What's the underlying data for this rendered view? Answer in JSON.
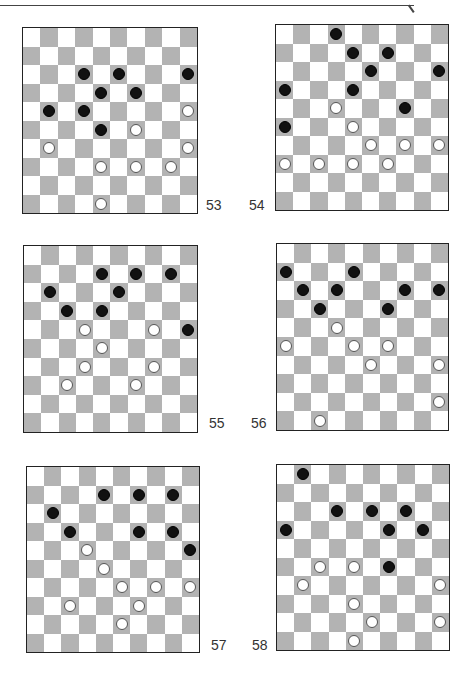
{
  "header": {
    "text": ""
  },
  "colors": {
    "dark_square": "#b3b3b3",
    "light_square": "#ffffff",
    "black_piece": "#111111",
    "white_piece": "#ffffff"
  },
  "boards": [
    {
      "number": "53",
      "black": [
        [
          2,
          3
        ],
        [
          2,
          5
        ],
        [
          2,
          9
        ],
        [
          3,
          4
        ],
        [
          3,
          6
        ],
        [
          4,
          1
        ],
        [
          4,
          3
        ],
        [
          5,
          4
        ]
      ],
      "white": [
        [
          4,
          9
        ],
        [
          5,
          6
        ],
        [
          6,
          1
        ],
        [
          6,
          9
        ],
        [
          7,
          4
        ],
        [
          7,
          6
        ],
        [
          7,
          8
        ],
        [
          9,
          4
        ]
      ]
    },
    {
      "number": "54",
      "black": [
        [
          0,
          3
        ],
        [
          1,
          4
        ],
        [
          1,
          6
        ],
        [
          2,
          5
        ],
        [
          2,
          9
        ],
        [
          3,
          0
        ],
        [
          3,
          4
        ],
        [
          4,
          7
        ],
        [
          5,
          0
        ]
      ],
      "white": [
        [
          4,
          3
        ],
        [
          5,
          4
        ],
        [
          6,
          5
        ],
        [
          6,
          7
        ],
        [
          6,
          9
        ],
        [
          7,
          0
        ],
        [
          7,
          2
        ],
        [
          7,
          4
        ],
        [
          7,
          6
        ]
      ]
    },
    {
      "number": "55",
      "black": [
        [
          1,
          4
        ],
        [
          1,
          6
        ],
        [
          1,
          8
        ],
        [
          2,
          1
        ],
        [
          2,
          5
        ],
        [
          3,
          2
        ],
        [
          3,
          4
        ],
        [
          4,
          9
        ]
      ],
      "white": [
        [
          4,
          3
        ],
        [
          4,
          7
        ],
        [
          5,
          4
        ],
        [
          6,
          3
        ],
        [
          6,
          7
        ],
        [
          7,
          2
        ],
        [
          7,
          6
        ]
      ]
    },
    {
      "number": "56",
      "black": [
        [
          1,
          0
        ],
        [
          1,
          4
        ],
        [
          2,
          1
        ],
        [
          2,
          3
        ],
        [
          2,
          7
        ],
        [
          2,
          9
        ],
        [
          3,
          2
        ],
        [
          3,
          6
        ]
      ],
      "white": [
        [
          4,
          3
        ],
        [
          5,
          0
        ],
        [
          5,
          4
        ],
        [
          5,
          6
        ],
        [
          6,
          5
        ],
        [
          6,
          9
        ],
        [
          8,
          9
        ],
        [
          9,
          2
        ]
      ]
    },
    {
      "number": "57",
      "black": [
        [
          1,
          4
        ],
        [
          1,
          6
        ],
        [
          1,
          8
        ],
        [
          2,
          1
        ],
        [
          3,
          2
        ],
        [
          3,
          6
        ],
        [
          3,
          8
        ],
        [
          4,
          9
        ]
      ],
      "white": [
        [
          4,
          3
        ],
        [
          5,
          4
        ],
        [
          6,
          5
        ],
        [
          6,
          7
        ],
        [
          6,
          9
        ],
        [
          7,
          2
        ],
        [
          7,
          6
        ],
        [
          8,
          5
        ]
      ]
    },
    {
      "number": "58",
      "black": [
        [
          0,
          1
        ],
        [
          2,
          3
        ],
        [
          2,
          5
        ],
        [
          2,
          7
        ],
        [
          3,
          0
        ],
        [
          3,
          6
        ],
        [
          3,
          8
        ],
        [
          5,
          6
        ]
      ],
      "white": [
        [
          5,
          2
        ],
        [
          5,
          4
        ],
        [
          6,
          1
        ],
        [
          6,
          9
        ],
        [
          7,
          4
        ],
        [
          8,
          5
        ],
        [
          8,
          9
        ],
        [
          9,
          4
        ]
      ]
    }
  ]
}
